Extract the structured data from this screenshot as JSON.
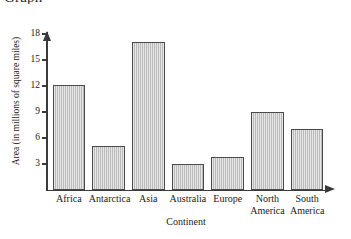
{
  "cropped_title": "Graph",
  "chart_data": {
    "type": "bar",
    "title": "",
    "xlabel": "Continent",
    "ylabel": "Area (in millions of square miles)",
    "categories": [
      "Africa",
      "Antarctica",
      "Asia",
      "Australia",
      "Europe",
      "North America",
      "South America"
    ],
    "category_lines": [
      [
        "Africa",
        ""
      ],
      [
        "Antarctica",
        ""
      ],
      [
        "Asia",
        ""
      ],
      [
        "Australia",
        ""
      ],
      [
        "Europe",
        ""
      ],
      [
        "North",
        "America"
      ],
      [
        "South",
        "America"
      ]
    ],
    "values": [
      12.1,
      5.0,
      17.0,
      3.0,
      3.8,
      8.9,
      7.0
    ],
    "ylim": [
      0,
      19
    ],
    "yticks": [
      3,
      6,
      9,
      12,
      15,
      18
    ],
    "ytick_labels": [
      "3",
      "6",
      "9",
      "12",
      "15",
      "18"
    ],
    "grid": false,
    "legend": false,
    "bar_fill_color": "#c9c9c9",
    "bar_edge_color": "#4a4a4a",
    "axis_color": "#3a3a3a",
    "axis_style": "arrow-terminated"
  }
}
